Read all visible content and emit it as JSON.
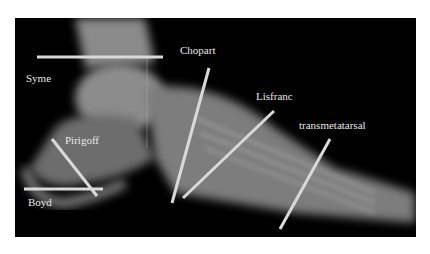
{
  "figure": {
    "labels": {
      "syme": "Syme",
      "chopart": "Chopart",
      "lisfranc": "Lisfranc",
      "transmetatarsal": "transmetatarsal",
      "pirigoff": "Pirigoff",
      "boyd": "Boyd"
    },
    "line_color": "#d9d9d9",
    "background": "#000000"
  }
}
